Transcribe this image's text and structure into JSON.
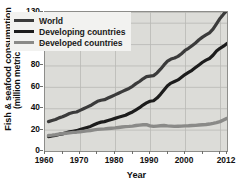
{
  "chart_data": {
    "type": "line",
    "title": "",
    "xlabel": "Year",
    "ylabel": "Fish & seafood consumption (million metric tons)",
    "ylabel_line1": "Fish & seafood consumption",
    "ylabel_line2": "(million metric tons)",
    "xlim": [
      1960,
      2012
    ],
    "ylim": [
      0,
      130
    ],
    "grid": true,
    "legend_position": "upper-left-inside",
    "y_ticks": [
      0,
      20,
      40,
      60,
      80,
      100,
      120,
      130
    ],
    "y_tick_labels": [
      "0",
      "20",
      "40",
      "60",
      "80",
      "100",
      "120",
      "130"
    ],
    "x_ticks": [
      1960,
      1970,
      1980,
      1990,
      2000,
      2012
    ],
    "x_tick_labels": [
      "1960",
      "1970",
      "1980",
      "1990",
      "2000",
      "2012"
    ],
    "x_minor_tick_interval": 5,
    "x": [
      1961,
      1962,
      1963,
      1964,
      1965,
      1966,
      1967,
      1968,
      1969,
      1970,
      1971,
      1972,
      1973,
      1974,
      1975,
      1976,
      1977,
      1978,
      1979,
      1980,
      1981,
      1982,
      1983,
      1984,
      1985,
      1986,
      1987,
      1988,
      1989,
      1990,
      1991,
      1992,
      1993,
      1994,
      1995,
      1996,
      1997,
      1998,
      1999,
      2000,
      2001,
      2002,
      2003,
      2004,
      2005,
      2006,
      2007,
      2008,
      2009,
      2010,
      2011,
      2012
    ],
    "series": [
      {
        "name": "World",
        "color": "#3b3b3b",
        "width": 3.2,
        "values": [
          27.5,
          28.5,
          29.5,
          31.0,
          32.0,
          33.5,
          35.0,
          36.0,
          36.5,
          38.0,
          39.5,
          41.0,
          42.5,
          44.5,
          46.5,
          47.5,
          48.0,
          49.5,
          51.0,
          52.5,
          54.0,
          55.5,
          57.0,
          58.5,
          60.5,
          63.0,
          65.0,
          67.5,
          69.5,
          70.0,
          70.5,
          73.0,
          76.5,
          80.5,
          84.0,
          86.0,
          87.0,
          88.5,
          91.0,
          94.0,
          96.0,
          98.5,
          101.0,
          104.0,
          106.5,
          108.5,
          110.5,
          114.0,
          119.0,
          124.0,
          128.0,
          131.5
        ]
      },
      {
        "name": "Developing countries",
        "color": "#1c1c1c",
        "width": 3.2,
        "values": [
          13.5,
          14.0,
          14.5,
          15.5,
          16.0,
          17.0,
          18.0,
          18.5,
          19.0,
          20.0,
          21.0,
          22.0,
          23.0,
          24.5,
          26.0,
          27.0,
          27.5,
          28.5,
          29.5,
          30.5,
          31.5,
          32.5,
          33.5,
          35.0,
          36.5,
          38.5,
          40.5,
          43.0,
          45.0,
          46.5,
          47.0,
          49.5,
          53.0,
          57.0,
          61.0,
          63.5,
          65.0,
          66.5,
          69.0,
          71.5,
          73.5,
          75.5,
          78.0,
          80.5,
          83.0,
          85.0,
          86.5,
          89.5,
          93.5,
          96.0,
          98.0,
          100.5
        ]
      },
      {
        "name": "Developed countries",
        "color": "#8a8a88",
        "width": 3.4,
        "values": [
          14.5,
          14.8,
          15.2,
          15.8,
          16.2,
          16.6,
          17.0,
          17.4,
          17.6,
          18.0,
          18.4,
          18.8,
          19.2,
          19.8,
          20.2,
          20.5,
          20.7,
          21.0,
          21.3,
          21.6,
          22.0,
          22.4,
          22.8,
          23.0,
          23.3,
          23.8,
          24.2,
          24.5,
          24.6,
          23.5,
          23.0,
          23.3,
          23.6,
          23.8,
          23.5,
          23.3,
          23.0,
          23.2,
          23.3,
          23.5,
          23.6,
          23.8,
          24.0,
          24.3,
          24.6,
          24.8,
          25.2,
          25.8,
          26.5,
          27.5,
          29.0,
          30.5
        ]
      }
    ],
    "legend": [
      {
        "label": "World",
        "color": "#3b3b3b"
      },
      {
        "label": "Developing countries",
        "color": "#1c1c1c"
      },
      {
        "label": "Developed countries",
        "color": "#8a8a88"
      }
    ],
    "colors": {
      "plot_background": "#dcdcd8",
      "grid": "#b9b9b5",
      "axis": "#6f6f6c",
      "legend_background": "#f2f2f0",
      "text": "#111111"
    }
  }
}
